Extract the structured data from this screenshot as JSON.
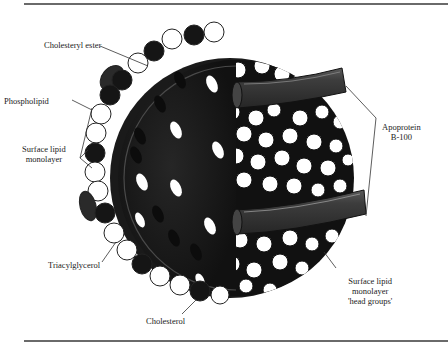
{
  "figure": {
    "labels": {
      "cholesteryl_ester": "Cholesteryl ester",
      "phospholipid": "Phospholipid",
      "surface_lipid_monolayer_line1": "Surface lipid",
      "surface_lipid_monolayer_line2": "monolayer",
      "triacylglycerol": "Triacylglycerol",
      "cholesterol": "Cholesterol",
      "apoprotein_line1": "Apoprotein",
      "apoprotein_line2": "B-100",
      "head_groups_line1": "Surface lipid",
      "head_groups_line2": "monolayer",
      "head_groups_line3": "'head groups'"
    },
    "colors": {
      "core": "#1c1c1c",
      "core_section": "#2a2a2a",
      "head_dark": "#151515",
      "head_light": "#ffffff",
      "apoprotein": "#3a3a3a",
      "rule": "#6a6a6a",
      "leader": "#333333"
    }
  }
}
